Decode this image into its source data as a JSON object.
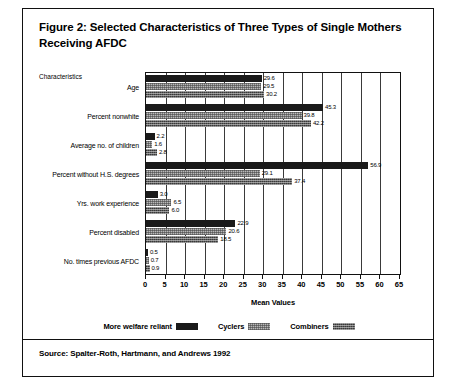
{
  "figure": {
    "title": "Figure 2: Selected Characteristics of Three Types of Single Mothers Receiving AFDC",
    "source": "Source: Spalter-Roth, Hartmann, and Andrews 1992",
    "category_axis_label": "Characteristics"
  },
  "chart_data": {
    "type": "bar",
    "orientation": "horizontal",
    "title": "Figure 2: Selected Characteristics of Three Types of Single Mothers Receiving AFDC",
    "xlabel": "Mean Values",
    "ylabel": "Characteristics",
    "xlim": [
      0,
      65
    ],
    "xticks": [
      0,
      5,
      10,
      15,
      20,
      25,
      30,
      35,
      40,
      45,
      50,
      55,
      60,
      65
    ],
    "grid": "vertical",
    "legend_position": "bottom-center",
    "categories": [
      "Age",
      "Percent nonwhite",
      "Average no. of children",
      "Percent without H.S. degrees",
      "Yrs. work experience",
      "Percent disabled",
      "No. times previous AFDC"
    ],
    "series": [
      {
        "name": "More welfare reliant",
        "color": "#1a1a1a",
        "values": [
          29.6,
          45.3,
          2.2,
          56.9,
          3.0,
          22.9,
          0.5
        ]
      },
      {
        "name": "Cyclers",
        "color": "#b9b9b9",
        "values": [
          29.5,
          39.8,
          1.6,
          29.1,
          6.5,
          20.6,
          0.7
        ]
      },
      {
        "name": "Combiners",
        "color": "#5d5d5d",
        "values": [
          30.2,
          42.2,
          2.8,
          37.4,
          6.0,
          18.5,
          0.9
        ]
      }
    ]
  }
}
